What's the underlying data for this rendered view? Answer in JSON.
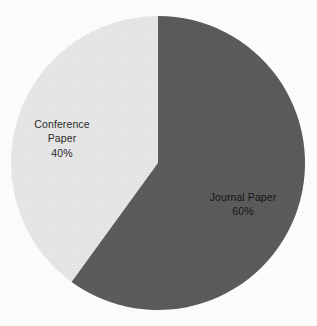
{
  "chart_data": {
    "type": "pie",
    "title": "",
    "subtitle": "",
    "xlabel": "",
    "ylabel": "",
    "legend": "none",
    "grid": false,
    "labels_position": "inside-slice",
    "start_angle_deg": 0,
    "direction": "clockwise",
    "categories": [
      "Journal Paper",
      "Conference Paper"
    ],
    "values": [
      60,
      40
    ],
    "unit": "%",
    "slices": [
      {
        "name": "Journal Paper",
        "value": 60,
        "percent_text": "60%",
        "color": "#5c5c5c",
        "angle_deg": 216,
        "label_lines": [
          "Journal Paper",
          "60%"
        ]
      },
      {
        "name": "Conference Paper",
        "value": 40,
        "percent_text": "40%",
        "color": "#e8e8e8",
        "angle_deg": 144,
        "label_lines": [
          "Conference",
          "Paper",
          "40%"
        ]
      }
    ]
  },
  "figure": {
    "background_color": "#ffffff",
    "center_x": 158,
    "center_y": 163,
    "radius": 147
  },
  "labels": {
    "conference": {
      "line1": "Conference",
      "line2": "Paper",
      "line3": "40%"
    },
    "journal": {
      "line1": "Journal Paper",
      "line2": "60%"
    }
  }
}
